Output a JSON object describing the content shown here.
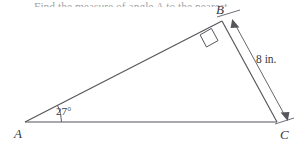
{
  "figure": {
    "type": "right-triangle-diagram",
    "background_color": "#ffffff",
    "stroke_color": "#55555c",
    "text_color": "#3a3a3e",
    "partial_prompt_text": "Find the measure of angle A to the nearest",
    "vertices": [
      {
        "id": "A",
        "label": "A",
        "x": 25,
        "y": 122
      },
      {
        "id": "B",
        "label": "B",
        "x": 222,
        "y": 21
      },
      {
        "id": "C",
        "label": "C",
        "x": 277,
        "y": 122
      }
    ],
    "labels": {
      "vertex_a": "A",
      "vertex_b": "B",
      "vertex_c": "C",
      "angle_a": "27°",
      "side_bc_length": "8 in."
    },
    "markers": {
      "right_angle_vertex": "B",
      "right_angle_value": "90°",
      "measured_angle_vertex": "A",
      "measured_angle_value": 27,
      "measured_angle_unit": "degrees",
      "dimension_side": "BC",
      "dimension_value": 8,
      "dimension_unit": "in."
    }
  }
}
